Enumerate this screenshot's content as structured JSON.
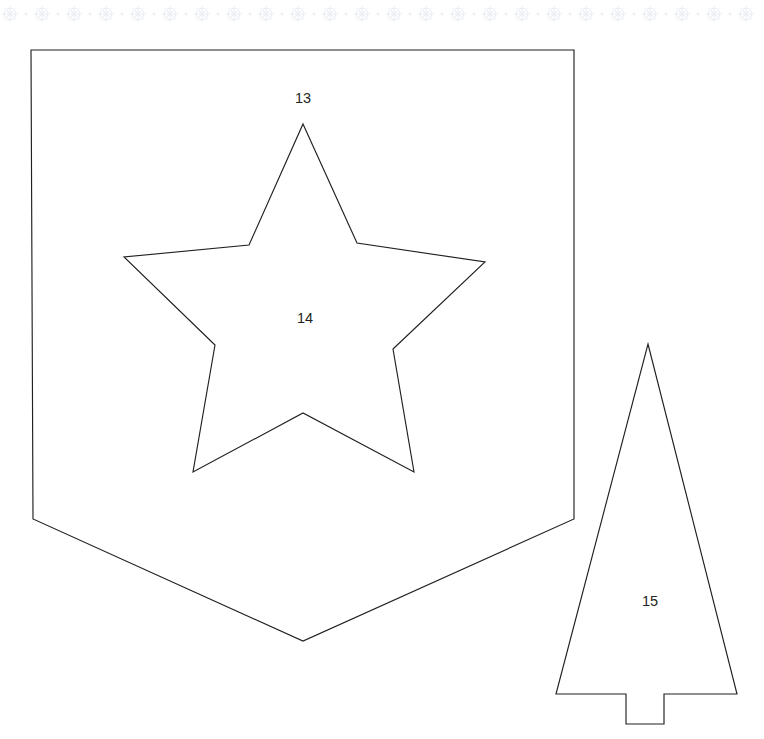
{
  "page": {
    "background_color": "#ffffff",
    "width": 764,
    "height": 739
  },
  "decorative_border": {
    "name": "snowflake-dot-border",
    "position": "top",
    "color": "#e9ecf2",
    "motif": "snowflake",
    "separator_motif": "dot",
    "motif_count": 24,
    "spacing_px": 32,
    "center_y": 14
  },
  "shapes": [
    {
      "id": "pentagon-banner",
      "name": "banner-shape",
      "label": "13",
      "label_x": 303,
      "label_y": 99,
      "stroke": "#231f20",
      "fill": "none",
      "points": "31,50 574,50 574,519 303,641 33,519"
    },
    {
      "id": "star",
      "name": "star-shape",
      "label": "14",
      "label_x": 305,
      "label_y": 319,
      "stroke": "#231f20",
      "fill": "none",
      "points": "303,124 357,243 485,262 393,349 414,472 303,413 193,472 215,345 124,257 249,245"
    },
    {
      "id": "tree",
      "name": "tree-shape",
      "label": "15",
      "label_x": 650,
      "label_y": 602,
      "stroke": "#231f20",
      "fill": "none",
      "points": "648,344 737,694 664,694 664,724 626,724 626,694 556,694"
    }
  ],
  "labels": [
    {
      "text": "13",
      "shape": "banner-shape"
    },
    {
      "text": "14",
      "shape": "star-shape"
    },
    {
      "text": "15",
      "shape": "tree-shape"
    }
  ]
}
